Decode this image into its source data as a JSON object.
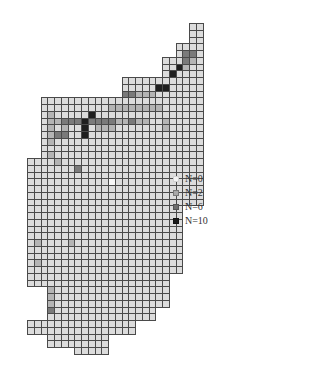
{
  "chart_data": {
    "type": "heatmap",
    "title": "",
    "grid": {
      "origin_x": 27,
      "origin_y": 23,
      "cell_size": 6.75,
      "columns": 27,
      "rows": 49
    },
    "levels": {
      "0": "#f7f7f7",
      "1": "#dcdcdc",
      "2": "#b4b4b4",
      "3": "#7a7a7a",
      "4": "#1e1e1e"
    },
    "rows_data": [
      {
        "row": 0,
        "start": 24,
        "cells": "11"
      },
      {
        "row": 1,
        "start": 24,
        "cells": "11"
      },
      {
        "row": 2,
        "start": 24,
        "cells": "11"
      },
      {
        "row": 3,
        "start": 22,
        "cells": "1111"
      },
      {
        "row": 4,
        "start": 22,
        "cells": "1331"
      },
      {
        "row": 5,
        "start": 20,
        "cells": "111321"
      },
      {
        "row": 6,
        "start": 20,
        "cells": "114211"
      },
      {
        "row": 7,
        "start": 20,
        "cells": "141111"
      },
      {
        "row": 8,
        "start": 14,
        "cells": "111111111111"
      },
      {
        "row": 9,
        "start": 14,
        "cells": "111114411111"
      },
      {
        "row": 10,
        "start": 14,
        "cells": "332221111111"
      },
      {
        "row": 11,
        "start": 2,
        "cells": "111111111111111111111111"
      },
      {
        "row": 12,
        "start": 2,
        "cells": "111111111122222222111111"
      },
      {
        "row": 13,
        "start": 2,
        "cells": "121111141111111111111111"
      },
      {
        "row": 14,
        "start": 2,
        "cells": "122333433332232211211111"
      },
      {
        "row": 15,
        "start": 2,
        "cells": "121211412221111111211111"
      },
      {
        "row": 16,
        "start": 2,
        "cells": "123311411111111111111111"
      },
      {
        "row": 17,
        "start": 2,
        "cells": "121111111111111111111111"
      },
      {
        "row": 18,
        "start": 2,
        "cells": "111111111111111111111111"
      },
      {
        "row": 19,
        "start": 2,
        "cells": "121111111111111111111111"
      },
      {
        "row": 20,
        "start": 0,
        "cells": "11112111111111111111111111"
      },
      {
        "row": 21,
        "start": 0,
        "cells": "11111113111111111111111111"
      },
      {
        "row": 22,
        "start": 0,
        "cells": "11111111111111111111111111"
      },
      {
        "row": 23,
        "start": 0,
        "cells": "11111111111101111111111111"
      },
      {
        "row": 24,
        "start": 0,
        "cells": "11111111111111111111111111"
      },
      {
        "row": 25,
        "start": 0,
        "cells": "11111111111111111111111111"
      },
      {
        "row": 26,
        "start": 0,
        "cells": "11111111111111111111111111"
      },
      {
        "row": 27,
        "start": 0,
        "cells": "11111111111111111111111"
      },
      {
        "row": 28,
        "start": 0,
        "cells": "11111111111111111111111"
      },
      {
        "row": 29,
        "start": 0,
        "cells": "11111111111111111111111"
      },
      {
        "row": 30,
        "start": 0,
        "cells": "11111111111111111111111"
      },
      {
        "row": 31,
        "start": 0,
        "cells": "11111111111111111111111"
      },
      {
        "row": 32,
        "start": 0,
        "cells": "12111121111111111111111"
      },
      {
        "row": 33,
        "start": 0,
        "cells": "11111111111111111111111"
      },
      {
        "row": 34,
        "start": 0,
        "cells": "11111111111111111111111"
      },
      {
        "row": 35,
        "start": 0,
        "cells": "12111111111111111111111"
      },
      {
        "row": 36,
        "start": 0,
        "cells": "11111111111111111111111"
      },
      {
        "row": 37,
        "start": 0,
        "cells": "111111111111111111111"
      },
      {
        "row": 38,
        "start": 0,
        "cells": "111111111111111111111"
      },
      {
        "row": 39,
        "start": 3,
        "cells": "211111111111111111"
      },
      {
        "row": 40,
        "start": 3,
        "cells": "211111111111111111"
      },
      {
        "row": 41,
        "start": 3,
        "cells": "211111111111111111"
      },
      {
        "row": 42,
        "start": 3,
        "cells": "3111111111111111"
      },
      {
        "row": 43,
        "start": 3,
        "cells": "1111111111111111"
      },
      {
        "row": 44,
        "start": 0,
        "cells": "1111111111111111"
      },
      {
        "row": 45,
        "start": 0,
        "cells": "1111111111111111"
      },
      {
        "row": 46,
        "start": 3,
        "cells": "111111111"
      },
      {
        "row": 47,
        "start": 3,
        "cells": "111111111"
      },
      {
        "row": 48,
        "start": 7,
        "cells": "11111"
      }
    ],
    "legend": {
      "position": "right",
      "entries": [
        {
          "label": "N=0",
          "color": "#f2f2f2",
          "border": "#d0d0d0"
        },
        {
          "label": "N=2",
          "color": "#a8a8a8",
          "border": "#777777"
        },
        {
          "label": "N=6",
          "color": "#6e6e6e",
          "border": "#555555"
        },
        {
          "label": "N=10",
          "color": "#1a1a1a",
          "border": "#111111"
        }
      ]
    }
  }
}
